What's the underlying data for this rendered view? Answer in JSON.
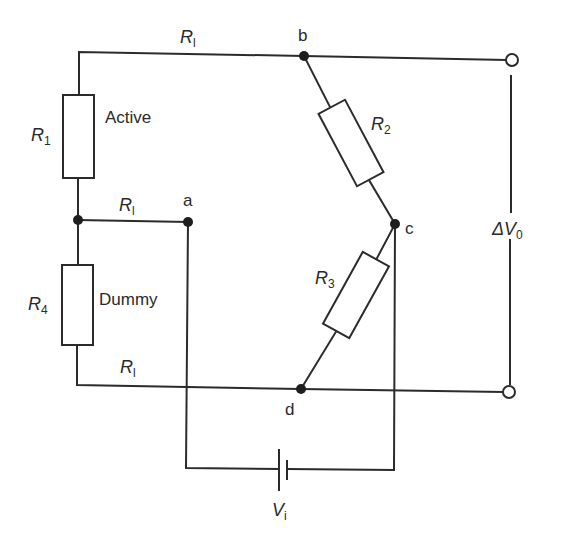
{
  "diagram": {
    "type": "circuit",
    "colors": {
      "line": "#2b2b2b",
      "node": "#1e1e1e",
      "background": "#ffffff"
    },
    "nodes": [
      {
        "id": "a",
        "label": "a"
      },
      {
        "id": "b",
        "label": "b"
      },
      {
        "id": "c",
        "label": "c"
      },
      {
        "id": "d",
        "label": "d"
      }
    ],
    "resistors": [
      {
        "id": "R1",
        "symbol": "R",
        "sub": "1",
        "description": "Active"
      },
      {
        "id": "R2",
        "symbol": "R",
        "sub": "2"
      },
      {
        "id": "R3",
        "symbol": "R",
        "sub": "3"
      },
      {
        "id": "R4",
        "symbol": "R",
        "sub": "4",
        "description": "Dummy"
      }
    ],
    "lead_resistances": [
      {
        "position": "top",
        "symbol": "R",
        "sub": "l"
      },
      {
        "position": "middle",
        "symbol": "R",
        "sub": "l"
      },
      {
        "position": "bottom",
        "symbol": "R",
        "sub": "l"
      }
    ],
    "output": {
      "symbol": "ΔV",
      "sub": "0"
    },
    "source": {
      "symbol": "V",
      "sub": "i"
    }
  }
}
